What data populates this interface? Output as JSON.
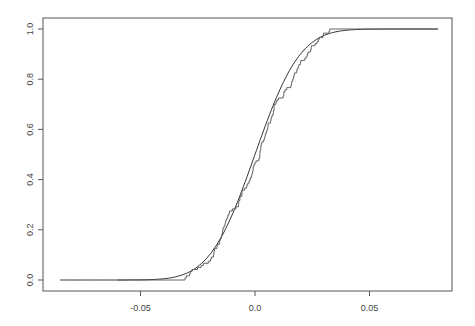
{
  "chart_data": {
    "type": "line",
    "title": "",
    "xlabel": "",
    "ylabel": "",
    "xlim": [
      -0.09,
      0.085
    ],
    "ylim": [
      0.0,
      1.0
    ],
    "grid": false,
    "legend": null,
    "x_ticks": [
      "-0.05",
      "0.0",
      "0.05"
    ],
    "y_ticks": [
      "0.0",
      "0.2",
      "0.4",
      "0.6",
      "0.8",
      "1.0"
    ],
    "series": [
      {
        "name": "theoretical CDF (smooth)",
        "x": [
          -0.085,
          -0.06,
          -0.05,
          -0.04,
          -0.035,
          -0.03,
          -0.025,
          -0.02,
          -0.015,
          -0.01,
          -0.005,
          0.0,
          0.005,
          0.01,
          0.015,
          0.02,
          0.025,
          0.03,
          0.035,
          0.04,
          0.05,
          0.06,
          0.08
        ],
        "values": [
          0.0,
          0.003,
          0.01,
          0.035,
          0.06,
          0.1,
          0.16,
          0.24,
          0.33,
          0.42,
          0.48,
          0.53,
          0.6,
          0.68,
          0.76,
          0.84,
          0.9,
          0.94,
          0.965,
          0.98,
          0.995,
          1.0,
          1.0
        ]
      },
      {
        "name": "empirical CDF (step)",
        "x": [
          -0.06,
          -0.05,
          -0.04,
          -0.035,
          -0.03,
          -0.025,
          -0.02,
          -0.015,
          -0.01,
          -0.005,
          0.0,
          0.005,
          0.01,
          0.015,
          0.02,
          0.025,
          0.03,
          0.035,
          0.04,
          0.05,
          0.06
        ],
        "values": [
          0.0,
          0.008,
          0.03,
          0.05,
          0.085,
          0.13,
          0.2,
          0.3,
          0.4,
          0.46,
          0.53,
          0.62,
          0.7,
          0.78,
          0.86,
          0.91,
          0.94,
          0.96,
          0.975,
          0.99,
          1.0
        ]
      }
    ]
  },
  "axes": {
    "x_ticks": [
      {
        "label": "-0.05",
        "value": -0.05
      },
      {
        "label": "0.0",
        "value": 0.0
      },
      {
        "label": "0.05",
        "value": 0.05
      }
    ],
    "y_ticks": [
      {
        "label": "0.0",
        "value": 0.0
      },
      {
        "label": "0.2",
        "value": 0.2
      },
      {
        "label": "0.4",
        "value": 0.4
      },
      {
        "label": "0.6",
        "value": 0.6
      },
      {
        "label": "0.8",
        "value": 0.8
      },
      {
        "label": "1.0",
        "value": 1.0
      }
    ]
  },
  "colors": {
    "axis": "#555555",
    "line": "#333333",
    "background": "#ffffff"
  }
}
